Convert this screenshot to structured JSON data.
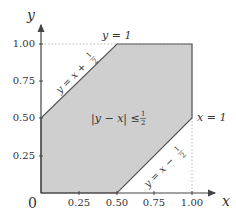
{
  "diagram": {
    "region_label": "|y − x| ≤ ½",
    "region_label_parts": {
      "lhs": "|y − x| ≤ ",
      "frac_num": "1",
      "frac_den": "2"
    },
    "lines": {
      "upper": {
        "label_lhs": "y = x + ",
        "frac_num": "1",
        "frac_den": "2"
      },
      "lower": {
        "label_lhs": "y = x − ",
        "frac_num": "1",
        "frac_den": "2"
      },
      "top": {
        "label": "y = 1"
      },
      "right": {
        "label": "x = 1"
      }
    },
    "axes": {
      "x_label": "x",
      "y_label": "y",
      "origin_label": "0",
      "x_ticks": [
        "0.25",
        "0.50",
        "0.75",
        "1.00"
      ],
      "y_ticks": [
        "0.25",
        "0.50",
        "0.75",
        "1.00"
      ]
    },
    "colors": {
      "region_fill": "#cfcfcf",
      "region_stroke": "#444444",
      "axis": "#444444",
      "guide": "#aaaaaa"
    }
  }
}
